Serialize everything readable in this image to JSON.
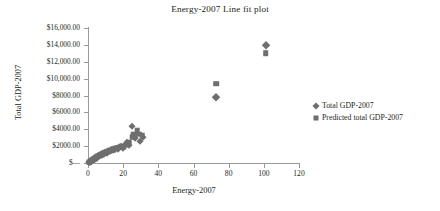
{
  "chart_data": {
    "type": "scatter",
    "title": "Energy-2007 Line fit plot",
    "xlabel": "Energy-2007",
    "ylabel": "Total GDP-2007",
    "xlim": [
      0,
      120
    ],
    "ylim": [
      0,
      16000
    ],
    "grid": false,
    "legend_position": "right",
    "xticks": [
      "0",
      "20",
      "40",
      "60",
      "80",
      "100",
      "120"
    ],
    "xtick_values": [
      0,
      20,
      40,
      60,
      80,
      100,
      120
    ],
    "yticks": [
      "$—",
      "$2000.00",
      "$4000.00",
      "$6000.00",
      "$8000.00",
      "$10,000.00",
      "$12,000.00",
      "$14,000.00",
      "$16,000.00"
    ],
    "ytick_values": [
      0,
      2000,
      4000,
      6000,
      8000,
      10000,
      12000,
      14000,
      16000
    ],
    "series": [
      {
        "name": "Total GDP-2007",
        "marker": "diamond",
        "color": "#6e6e6e",
        "points": [
          [
            0.5,
            60
          ],
          [
            0.7,
            90
          ],
          [
            0.9,
            120
          ],
          [
            1.1,
            150
          ],
          [
            1.3,
            180
          ],
          [
            1.5,
            210
          ],
          [
            1.7,
            250
          ],
          [
            1.9,
            280
          ],
          [
            2.1,
            320
          ],
          [
            2.3,
            360
          ],
          [
            2.5,
            300
          ],
          [
            2.7,
            420
          ],
          [
            2.9,
            380
          ],
          [
            3.1,
            450
          ],
          [
            3.3,
            500
          ],
          [
            3.5,
            430
          ],
          [
            3.7,
            560
          ],
          [
            3.9,
            520
          ],
          [
            4.1,
            610
          ],
          [
            4.3,
            580
          ],
          [
            4.5,
            660
          ],
          [
            4.8,
            700
          ],
          [
            5.0,
            640
          ],
          [
            5.3,
            760
          ],
          [
            5.6,
            820
          ],
          [
            5.9,
            780
          ],
          [
            6.2,
            870
          ],
          [
            6.5,
            930
          ],
          [
            6.8,
            890
          ],
          [
            7.1,
            980
          ],
          [
            7.5,
            1040
          ],
          [
            7.9,
            1000
          ],
          [
            8.3,
            1120
          ],
          [
            8.7,
            1180
          ],
          [
            9.1,
            1090
          ],
          [
            9.6,
            1260
          ],
          [
            10.1,
            1320
          ],
          [
            10.6,
            1230
          ],
          [
            11.2,
            1400
          ],
          [
            11.8,
            1460
          ],
          [
            12.4,
            1380
          ],
          [
            13.0,
            1540
          ],
          [
            13.7,
            1620
          ],
          [
            14.4,
            1520
          ],
          [
            15.2,
            1700
          ],
          [
            16.0,
            1790
          ],
          [
            16.9,
            1680
          ],
          [
            17.8,
            1880
          ],
          [
            18.8,
            1960
          ],
          [
            19.9,
            1830
          ],
          [
            21.0,
            2080
          ],
          [
            22.3,
            2460
          ],
          [
            23.5,
            2180
          ],
          [
            24.8,
            4340
          ],
          [
            25.6,
            3260
          ],
          [
            26.8,
            2980
          ],
          [
            28.0,
            3560
          ],
          [
            29.5,
            2620
          ],
          [
            31.0,
            3080
          ],
          [
            73.0,
            7880
          ],
          [
            101.0,
            14000
          ]
        ]
      },
      {
        "name": "Predicted total GDP-2007",
        "marker": "square",
        "color": "#6e6e6e",
        "points": [
          [
            0.5,
            80
          ],
          [
            0.7,
            100
          ],
          [
            0.9,
            130
          ],
          [
            1.1,
            160
          ],
          [
            1.3,
            195
          ],
          [
            1.5,
            225
          ],
          [
            1.7,
            260
          ],
          [
            1.9,
            295
          ],
          [
            2.1,
            330
          ],
          [
            2.3,
            370
          ],
          [
            2.5,
            340
          ],
          [
            2.7,
            430
          ],
          [
            2.9,
            400
          ],
          [
            3.1,
            470
          ],
          [
            3.3,
            510
          ],
          [
            3.5,
            455
          ],
          [
            3.7,
            575
          ],
          [
            3.9,
            540
          ],
          [
            4.1,
            620
          ],
          [
            4.3,
            600
          ],
          [
            4.5,
            675
          ],
          [
            4.8,
            715
          ],
          [
            5.0,
            660
          ],
          [
            5.3,
            775
          ],
          [
            5.6,
            835
          ],
          [
            5.9,
            795
          ],
          [
            6.2,
            885
          ],
          [
            6.5,
            945
          ],
          [
            6.8,
            905
          ],
          [
            7.1,
            995
          ],
          [
            7.5,
            1060
          ],
          [
            7.9,
            1020
          ],
          [
            8.3,
            1140
          ],
          [
            8.7,
            1200
          ],
          [
            9.1,
            1110
          ],
          [
            9.6,
            1285
          ],
          [
            10.1,
            1345
          ],
          [
            10.6,
            1255
          ],
          [
            11.2,
            1425
          ],
          [
            11.8,
            1485
          ],
          [
            12.4,
            1405
          ],
          [
            13.0,
            1565
          ],
          [
            13.7,
            1645
          ],
          [
            14.4,
            1545
          ],
          [
            15.2,
            1725
          ],
          [
            16.0,
            1815
          ],
          [
            16.9,
            1705
          ],
          [
            17.8,
            1905
          ],
          [
            18.8,
            1985
          ],
          [
            19.9,
            1855
          ],
          [
            21.0,
            2110
          ],
          [
            22.3,
            2320
          ],
          [
            23.5,
            2500
          ],
          [
            24.8,
            2980
          ],
          [
            25.6,
            3420
          ],
          [
            26.8,
            3180
          ],
          [
            28.0,
            3880
          ],
          [
            29.5,
            3420
          ],
          [
            31.0,
            3300
          ],
          [
            73.0,
            9420
          ],
          [
            101.0,
            13000
          ]
        ]
      }
    ]
  },
  "legend": {
    "entries": [
      {
        "label": "Total GDP-2007",
        "marker": "diamond"
      },
      {
        "label": "Predicted total GDP-2007",
        "marker": "square"
      }
    ]
  },
  "colors": {
    "marker": "#6e6e6e",
    "axis": "#9a9a9a",
    "text": "#231f20",
    "background": "#ffffff"
  }
}
